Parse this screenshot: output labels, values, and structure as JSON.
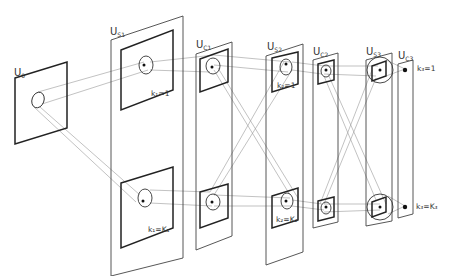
{
  "diagram": {
    "layers": [
      {
        "id": "U0",
        "main": "U",
        "sub": "0"
      },
      {
        "id": "US1",
        "main": "U",
        "sub": "S1"
      },
      {
        "id": "UC1",
        "main": "U",
        "sub": "C1"
      },
      {
        "id": "US2",
        "main": "U",
        "sub": "S2"
      },
      {
        "id": "UC2",
        "main": "U",
        "sub": "C2"
      },
      {
        "id": "US3",
        "main": "U",
        "sub": "S3"
      },
      {
        "id": "UC3",
        "main": "U",
        "sub": "C3"
      }
    ],
    "plane_labels": {
      "k1_first": "k₁=1",
      "k1_last": "k₁=K₁",
      "k2_first": "k₂=1",
      "k2_last": "k₂=K₂",
      "k3_first": "k₃=1",
      "k3_last": "k₃=K₃"
    },
    "colors": {
      "frame": "#444444",
      "plane": "#222222",
      "connection": "#999999"
    }
  }
}
